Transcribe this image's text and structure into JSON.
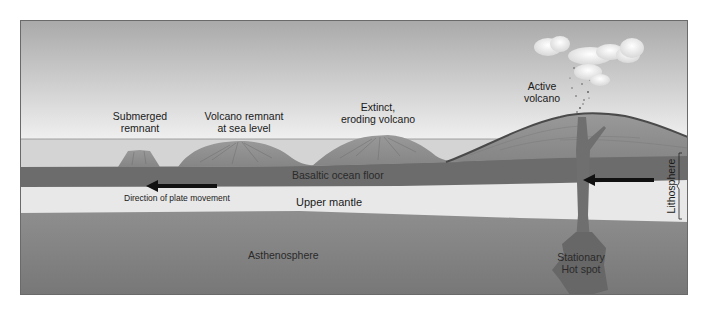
{
  "frame": {
    "x": 20,
    "y": 20,
    "width": 668,
    "height": 275
  },
  "colors": {
    "sky_top": "#a9a9a9",
    "sky_bottom": "#f0f0f0",
    "sea": "#d6d6d6",
    "sea_line": "#8a8a8a",
    "volcano": "#8e8e8e",
    "volcano_dark": "#5c5c5c",
    "ocean_floor": "#6e6e6e",
    "upper_mantle": "#e9e9e9",
    "asthenosphere_top": "#8c8c8c",
    "asthenosphere_bottom": "#7a7a7a",
    "plume": "#727272",
    "hot_spot": "#666666",
    "arrow": "#111111",
    "frame_border": "#6a6a6a",
    "cloud": "#f4f4f4"
  },
  "labels": {
    "submerged_remnant": [
      "Submerged",
      "remnant"
    ],
    "volcano_remnant_sea_level": [
      "Volcano remnant",
      "at sea level"
    ],
    "extinct_eroding_volcano": [
      "Extinct,",
      "eroding volcano"
    ],
    "active_volcano": [
      "Active",
      "volcano"
    ],
    "basaltic_ocean_floor": "Basaltic ocean floor",
    "upper_mantle": "Upper mantle",
    "direction_of_plate_movement": "Direction of plate movement",
    "asthenosphere": "Asthenosphere",
    "stationary_hot_spot": [
      "Stationary",
      "Hot spot"
    ],
    "lithosphere": "Lithosphere"
  },
  "arrows": [
    {
      "name": "plate-movement-arrow-left",
      "x1": 216,
      "x2": 146,
      "y": 186,
      "direction": "left"
    },
    {
      "name": "plate-movement-arrow-right",
      "x1": 654,
      "x2": 584,
      "y": 180,
      "direction": "left"
    }
  ]
}
